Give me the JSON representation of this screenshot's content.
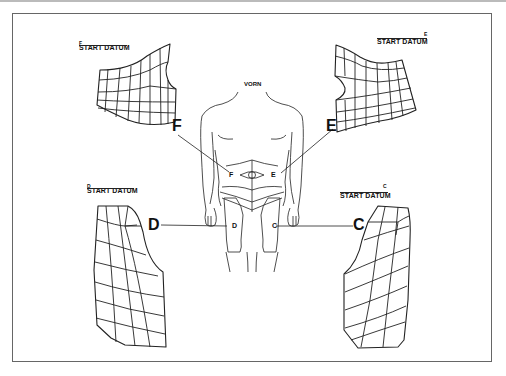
{
  "diagram": {
    "front_label": "VORN",
    "datum_label": "START DATUM",
    "panels": [
      {
        "id": "F",
        "position": "top-left",
        "datum_letter": "F",
        "pointer_letter": "F",
        "body_letter": "F"
      },
      {
        "id": "E",
        "position": "top-right",
        "datum_letter": "E",
        "pointer_letter": "E",
        "body_letter": "E"
      },
      {
        "id": "D",
        "position": "bottom-left",
        "datum_letter": "D",
        "pointer_letter": "D",
        "body_letter": "D"
      },
      {
        "id": "C",
        "position": "bottom-right",
        "datum_letter": "C",
        "pointer_letter": "C",
        "body_letter": "C"
      }
    ],
    "colors": {
      "line": "#222222",
      "frame": "#666666",
      "background": "#ffffff"
    }
  }
}
